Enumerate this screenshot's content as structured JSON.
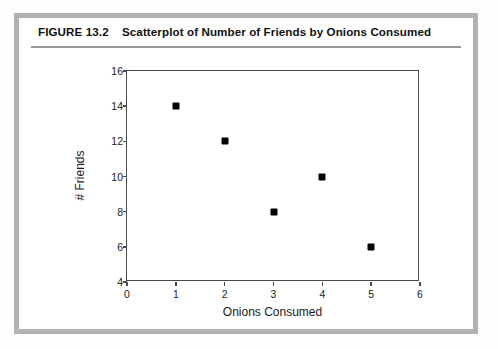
{
  "figure": {
    "number_label": "FIGURE 13.2",
    "caption": "Scatterplot of Number of Friends by Onions Consumed",
    "caption_full": "FIGURE 13.2    Scatterplot of Number of Friends by Onions Consumed",
    "border_color": "#b2b2b2",
    "rule_color": "#9a9a9a"
  },
  "chart_data": {
    "type": "scatter",
    "title": "Scatterplot of Number of Friends by Onions Consumed",
    "xlabel": "Onions Consumed",
    "ylabel": "# Friends",
    "x": [
      1,
      2,
      3,
      4,
      5
    ],
    "values": [
      14,
      12,
      8,
      10,
      6
    ],
    "points": [
      {
        "x": 1,
        "y": 14
      },
      {
        "x": 2,
        "y": 12
      },
      {
        "x": 3,
        "y": 8
      },
      {
        "x": 4,
        "y": 10
      },
      {
        "x": 5,
        "y": 6
      }
    ],
    "xlim": [
      0,
      6
    ],
    "ylim": [
      4,
      16
    ],
    "xticks": [
      0,
      1,
      2,
      3,
      4,
      5,
      6
    ],
    "yticks": [
      4,
      6,
      8,
      10,
      12,
      14,
      16
    ],
    "xtick_labels": [
      "0",
      "1",
      "2",
      "3",
      "4",
      "5",
      "6"
    ],
    "ytick_labels": [
      "4",
      "6",
      "8",
      "10",
      "12",
      "14",
      "16"
    ],
    "grid": false,
    "legend": null,
    "marker": "square",
    "marker_color": "#000000",
    "axis_color": "#4a4a4a",
    "plot_background": "#ffffff"
  }
}
